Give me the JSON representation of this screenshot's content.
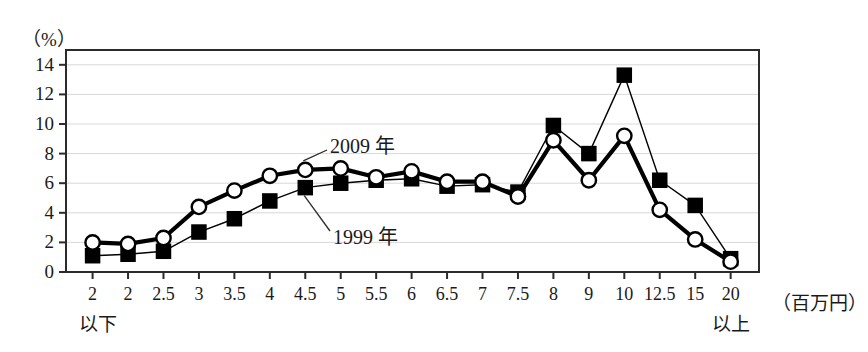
{
  "chart_data": {
    "type": "line",
    "title": "",
    "xlabel": "百万円",
    "ylabel": "%",
    "ylim": [
      0,
      15
    ],
    "yticks": [
      0,
      2,
      4,
      6,
      8,
      10,
      12,
      14
    ],
    "grid": true,
    "legend_position": "inline-annotation",
    "categories": [
      "2",
      "2",
      "2.5",
      "3",
      "3.5",
      "4",
      "4.5",
      "5",
      "5.5",
      "6",
      "6.5",
      "7",
      "7.5",
      "8",
      "9",
      "10",
      "12.5",
      "15",
      "20"
    ],
    "category_notes": {
      "first": "以下",
      "last": "以上"
    },
    "series": [
      {
        "name": "2009 年",
        "marker": "open-circle",
        "line_weight": "thick",
        "values": [
          2.0,
          1.9,
          2.3,
          4.4,
          5.5,
          6.5,
          6.9,
          7.0,
          6.4,
          6.8,
          6.1,
          6.1,
          5.1,
          8.9,
          6.2,
          9.2,
          4.2,
          2.2,
          0.7
        ]
      },
      {
        "name": "1999 年",
        "marker": "filled-square",
        "line_weight": "thin",
        "values": [
          1.1,
          1.2,
          1.4,
          2.7,
          3.6,
          4.8,
          5.7,
          6.0,
          6.2,
          6.3,
          5.8,
          5.9,
          5.4,
          9.9,
          8.0,
          13.3,
          6.2,
          4.5,
          0.9
        ]
      }
    ],
    "annotations": [
      {
        "label": "2009 年",
        "points_to_series": "2009 年",
        "points_to_index": 6
      },
      {
        "label": "1999 年",
        "points_to_series": "1999 年",
        "points_to_index": 6
      }
    ],
    "colors": {
      "line": "#000000",
      "grid": "#d8d8d8",
      "axis": "#2b2b2b",
      "marker_fill_open": "#ffffff",
      "marker_fill_closed": "#000000"
    }
  },
  "axes": {
    "y_unit_label": "（%）",
    "x_unit_label": "（百万円）",
    "y_tick_labels": [
      "14",
      "12",
      "10",
      "8",
      "6",
      "4",
      "2",
      "0"
    ],
    "x_tick_labels": [
      "2",
      "2",
      "2.5",
      "3",
      "3.5",
      "4",
      "4.5",
      "5",
      "5.5",
      "6",
      "6.5",
      "7",
      "7.5",
      "8",
      "9",
      "10",
      "12.5",
      "15",
      "20"
    ],
    "below_note": "以下",
    "above_note": "以上"
  },
  "series_labels": {
    "upper": "2009 年",
    "lower": "1999 年"
  }
}
